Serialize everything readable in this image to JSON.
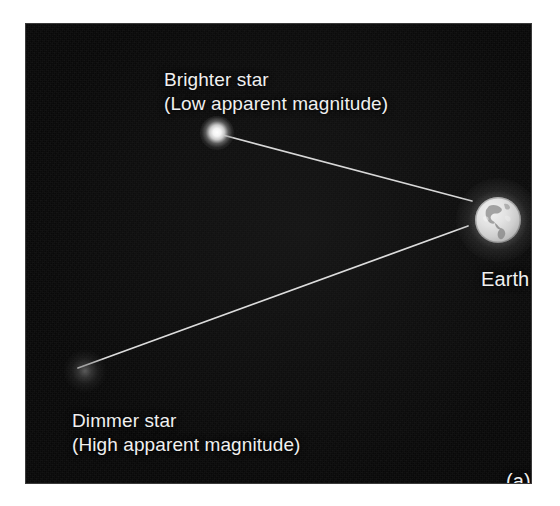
{
  "figure": {
    "panel_tag": "(a)",
    "background_color": "#ffffff",
    "sky_color": "#080808",
    "line_color": "#d8d8d8",
    "text_color": "#f0f0f0"
  },
  "labels": {
    "brighter_star_line1": "Brighter star",
    "brighter_star_line2": "(Low apparent magnitude)",
    "dimmer_star_line1": "Dimmer star",
    "dimmer_star_line2": "(High apparent magnitude)",
    "earth": "Earth"
  },
  "objects": [
    {
      "name": "brighter-star",
      "label": "Brighter star",
      "sublabel": "(Low apparent magnitude)",
      "brightness": "bright",
      "x": 210,
      "y": 128
    },
    {
      "name": "dimmer-star",
      "label": "Dimmer star",
      "sublabel": "(High apparent magnitude)",
      "brightness": "dim",
      "x": 62,
      "y": 362
    },
    {
      "name": "earth",
      "label": "Earth",
      "brightness": "bright",
      "x": 485,
      "y": 209
    }
  ],
  "sight_lines": [
    {
      "name": "brighter-star-to-earth",
      "from": "brighter-star",
      "to": "earth"
    },
    {
      "name": "dimmer-star-to-earth",
      "from": "dimmer-star",
      "to": "earth"
    }
  ]
}
